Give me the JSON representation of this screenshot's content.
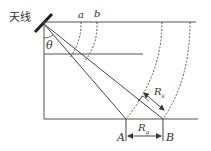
{
  "labels": {
    "antenna": "天线",
    "theta": "θ",
    "a": "a",
    "b": "b",
    "Rs_main": "R",
    "Rs_sub": "s",
    "Rg_main": "R",
    "Rg_sub": "g",
    "A": "A",
    "B": "B"
  },
  "colors": {
    "line": "#3a3a3a",
    "background": "#ffffff"
  }
}
